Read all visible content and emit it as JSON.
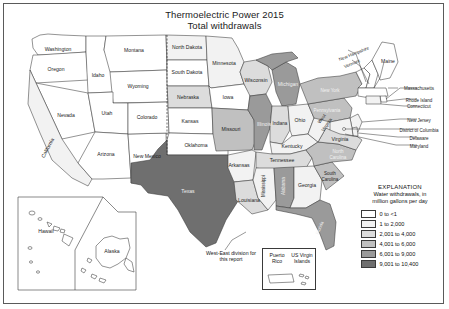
{
  "title": {
    "line1": "Thermoelectric Power 2015",
    "line2": "Total withdrawals"
  },
  "legend": {
    "heading": "EXPLANATION",
    "subheading_line1": "Water withdrawals, in",
    "subheading_line2": "million gallons per day",
    "classes": [
      {
        "label": "0 to <1",
        "color": "#ffffff"
      },
      {
        "label": "1 to 2,000",
        "color": "#f2f2f2"
      },
      {
        "label": "2,001 to 4,000",
        "color": "#dcdcdc"
      },
      {
        "label": "4,001 to 6,000",
        "color": "#c0c0c0"
      },
      {
        "label": "6,001 to 9,000",
        "color": "#9a9a9a"
      },
      {
        "label": "9,001 to 10,400",
        "color": "#6f6f6f"
      }
    ]
  },
  "notes": {
    "west_east": "West-East division for this report"
  },
  "insets": {
    "puerto_rico": "Puerto Rico",
    "virgin_islands": "US Virgin Islands",
    "hawaii": "Hawaii",
    "alaska": "Alaska"
  },
  "chart_data": {
    "type": "map",
    "title": "Thermoelectric Power 2015 Total withdrawals",
    "value_unit": "million gallons per day",
    "classes": [
      "0 to <1",
      "1 to 2,000",
      "2,001 to 4,000",
      "4,001 to 6,000",
      "6,001 to 9,000",
      "9,001 to 10,400"
    ],
    "regions": [
      {
        "name": "Washington",
        "class": "0 to <1"
      },
      {
        "name": "Oregon",
        "class": "0 to <1"
      },
      {
        "name": "Idaho",
        "class": "0 to <1"
      },
      {
        "name": "Montana",
        "class": "0 to <1"
      },
      {
        "name": "Wyoming",
        "class": "0 to <1"
      },
      {
        "name": "Nevada",
        "class": "0 to <1"
      },
      {
        "name": "Utah",
        "class": "0 to <1"
      },
      {
        "name": "California",
        "class": "1 to 2,000"
      },
      {
        "name": "Arizona",
        "class": "0 to <1"
      },
      {
        "name": "New Mexico",
        "class": "0 to <1"
      },
      {
        "name": "Colorado",
        "class": "0 to <1"
      },
      {
        "name": "North Dakota",
        "class": "1 to 2,000"
      },
      {
        "name": "South Dakota",
        "class": "0 to <1"
      },
      {
        "name": "Nebraska",
        "class": "2,001 to 4,000"
      },
      {
        "name": "Kansas",
        "class": "0 to <1"
      },
      {
        "name": "Oklahoma",
        "class": "0 to <1"
      },
      {
        "name": "Texas",
        "class": "9,001 to 10,400"
      },
      {
        "name": "Minnesota",
        "class": "1 to 2,000"
      },
      {
        "name": "Iowa",
        "class": "0 to <1"
      },
      {
        "name": "Missouri",
        "class": "4,001 to 6,000"
      },
      {
        "name": "Arkansas",
        "class": "1 to 2,000"
      },
      {
        "name": "Louisiana",
        "class": "2,001 to 4,000"
      },
      {
        "name": "Wisconsin",
        "class": "2,001 to 4,000"
      },
      {
        "name": "Illinois",
        "class": "6,001 to 9,000"
      },
      {
        "name": "Michigan",
        "class": "6,001 to 9,000"
      },
      {
        "name": "Indiana",
        "class": "2,001 to 4,000"
      },
      {
        "name": "Ohio",
        "class": "1 to 2,000"
      },
      {
        "name": "Kentucky",
        "class": "1 to 2,000"
      },
      {
        "name": "Tennessee",
        "class": "2,001 to 4,000"
      },
      {
        "name": "Mississippi",
        "class": "1 to 2,000"
      },
      {
        "name": "Alabama",
        "class": "6,001 to 9,000"
      },
      {
        "name": "Georgia",
        "class": "1 to 2,000"
      },
      {
        "name": "Florida",
        "class": "6,001 to 9,000"
      },
      {
        "name": "South Carolina",
        "class": "4,001 to 6,000"
      },
      {
        "name": "North Carolina",
        "class": "4,001 to 6,000"
      },
      {
        "name": "Virginia",
        "class": "2,001 to 4,000"
      },
      {
        "name": "West Virginia",
        "class": "1 to 2,000"
      },
      {
        "name": "Pennsylvania",
        "class": "4,001 to 6,000"
      },
      {
        "name": "New York",
        "class": "4,001 to 6,000"
      },
      {
        "name": "Vermont",
        "class": "0 to <1"
      },
      {
        "name": "New Hampshire",
        "class": "0 to <1"
      },
      {
        "name": "Maine",
        "class": "0 to <1"
      },
      {
        "name": "Massachusetts",
        "class": "0 to <1"
      },
      {
        "name": "Rhode Island",
        "class": "0 to <1"
      },
      {
        "name": "Connecticut",
        "class": "1 to 2,000"
      },
      {
        "name": "New Jersey",
        "class": "1 to 2,000"
      },
      {
        "name": "Delaware",
        "class": "1 to 2,000"
      },
      {
        "name": "Maryland",
        "class": "1 to 2,000"
      },
      {
        "name": "District of Columbia",
        "class": "0 to <1"
      },
      {
        "name": "Hawaii",
        "class": "0 to <1"
      },
      {
        "name": "Alaska",
        "class": "0 to <1"
      },
      {
        "name": "Puerto Rico",
        "class": "0 to <1"
      },
      {
        "name": "US Virgin Islands",
        "class": "0 to <1"
      }
    ]
  },
  "labels": {
    "washington": "Washington",
    "oregon": "Oregon",
    "idaho": "Idaho",
    "montana": "Montana",
    "wyoming": "Wyoming",
    "nevada": "Nevada",
    "utah": "Utah",
    "california": "California",
    "arizona": "Arizona",
    "new_mexico": "New Mexico",
    "colorado": "Colorado",
    "north_dakota": "North Dakota",
    "south_dakota": "South Dakota",
    "nebraska": "Nebraska",
    "kansas": "Kansas",
    "oklahoma": "Oklahoma",
    "texas": "Texas",
    "minnesota": "Minnesota",
    "iowa": "Iowa",
    "missouri": "Missouri",
    "arkansas": "Arkansas",
    "louisiana": "Louisiana",
    "wisconsin": "Wisconsin",
    "illinois": "Illinois",
    "michigan": "Michigan",
    "indiana": "Indiana",
    "ohio": "Ohio",
    "kentucky": "Kentucky",
    "tennessee": "Tennessee",
    "mississippi": "Mississippi",
    "alabama": "Alabama",
    "georgia": "Georgia",
    "florida": "Florida",
    "south_carolina_1": "South",
    "south_carolina_2": "Carolina",
    "north_carolina_1": "North",
    "north_carolina_2": "Carolina",
    "virginia": "Virginia",
    "west_virginia_1": "West",
    "west_virginia_2": "Virginia",
    "pennsylvania": "Pennsylvania",
    "new_york": "New York",
    "vermont": "Vermont",
    "new_hampshire": "New Hampshire",
    "maine": "Maine",
    "massachusetts": "Massachusetts",
    "rhode_island": "Rhode Island",
    "connecticut": "Connecticut",
    "new_jersey": "New Jersey",
    "district_of_columbia": "District of Columbia",
    "delaware": "Delaware",
    "maryland": "Maryland",
    "hawaii": "Hawaii",
    "alaska": "Alaska"
  }
}
